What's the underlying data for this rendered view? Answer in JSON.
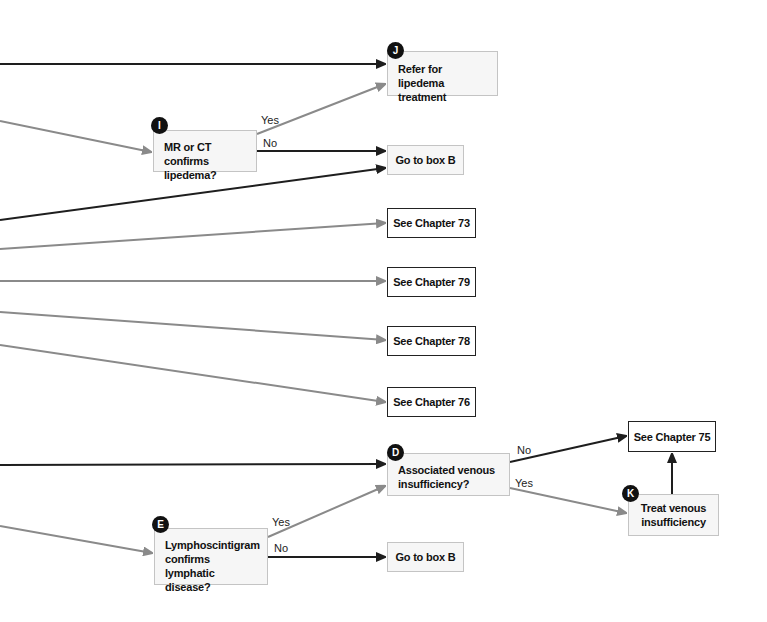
{
  "colors": {
    "dark_arrow": "#1e1e1e",
    "gray_arrow": "#8a8a8a",
    "decision_fill": "#f6f6f6",
    "decision_border": "#c4c4c4",
    "badge": "#111111"
  },
  "nodes": {
    "J": {
      "badge": "J",
      "text": "Refer for lipedema treatment"
    },
    "I": {
      "badge": "I",
      "text": "MR or CT confirms lipedema?"
    },
    "goto_b_top": {
      "text": "Go to box B"
    },
    "ch73": {
      "text": "See Chapter 73"
    },
    "ch79": {
      "text": "See Chapter 79"
    },
    "ch78": {
      "text": "See Chapter 78"
    },
    "ch76": {
      "text": "See Chapter 76"
    },
    "D": {
      "badge": "D",
      "text": "Associated venous insufficiency?"
    },
    "ch75": {
      "text": "See Chapter 75"
    },
    "K": {
      "badge": "K",
      "text": "Treat venous insufficiency"
    },
    "E": {
      "badge": "E",
      "text": "Lymphoscintigram confirms lymphatic disease?"
    },
    "goto_b_bottom": {
      "text": "Go to box B"
    }
  },
  "edge_labels": {
    "I_yes": "Yes",
    "I_no": "No",
    "D_no": "No",
    "D_yes": "Yes",
    "E_yes": "Yes",
    "E_no": "No"
  }
}
